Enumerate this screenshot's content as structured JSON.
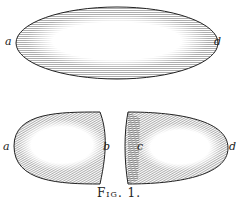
{
  "figure": {
    "caption": "Fig. 1.",
    "whole": {
      "label_left": "a",
      "label_right": "d"
    },
    "left_half": {
      "label_left": "a",
      "label_right": "b"
    },
    "right_half": {
      "label_left": "c",
      "label_right": "d"
    },
    "colors": {
      "ink": "#222222",
      "background": "#ffffff"
    }
  }
}
